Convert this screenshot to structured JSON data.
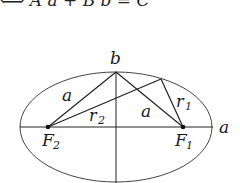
{
  "equation": {
    "text": "⟺  A a  + B b  = C"
  },
  "diagram": {
    "labels": {
      "b_top": "b",
      "a_axis": "a",
      "a_left": "a",
      "a_right": "a",
      "r1": "r",
      "r1_sub": "1",
      "r2": "r",
      "r2_sub": "2",
      "F1": "F",
      "F1_sub": "1",
      "F2": "F",
      "F2_sub": "2"
    },
    "colors": {
      "stroke": "#222222",
      "ellipse": "#444444"
    }
  }
}
